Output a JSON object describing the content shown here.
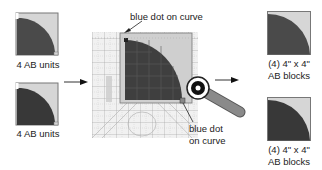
{
  "left_units": [
    {
      "label": "4 AB units"
    },
    {
      "label": "4 AB units"
    }
  ],
  "center": {
    "callout_top": "blue dot on curve",
    "callout_bottom_line1": "blue dot",
    "callout_bottom_line2": "on curve"
  },
  "right_blocks": [
    {
      "label_line1": "(4) 4\" x 4\"",
      "label_line2": "AB blocks"
    },
    {
      "label_line1": "(4) 4\" x 4\"",
      "label_line2": "AB blocks"
    }
  ],
  "colors": {
    "dark_fabric": "#4a4a4a",
    "darker_fabric": "#383838",
    "light_fabric": "#d6d6d6",
    "ruler_grid": "#9a9a9a",
    "outline": "#555555",
    "cutter_handle": "#8a8a8a"
  },
  "icons": [
    "arrow-right-icon",
    "arrow-right-icon",
    "rotary-cutter-icon",
    "ruler-icon"
  ]
}
